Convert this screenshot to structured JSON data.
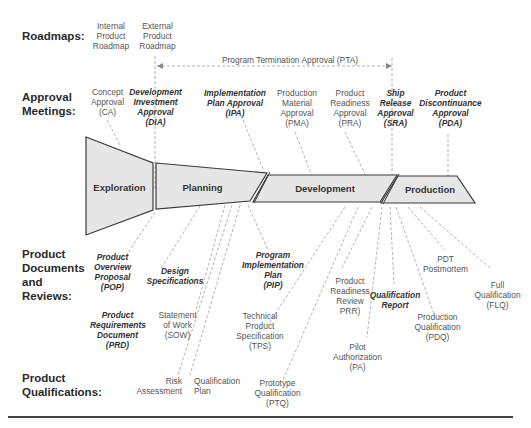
{
  "rows": {
    "roadmaps": "Roadmaps:",
    "approval": "Approval\nMeetings:",
    "documents": "Product\nDocuments\nand\nReviews:",
    "qualifications": "Product\nQualifications:"
  },
  "roadmaps": {
    "internal": "Internal\nProduct\nRoadmap",
    "external": "External\nProduct\nRoadmap"
  },
  "pta": "Program Termination Approval (PTA)",
  "approvals": {
    "ca": "Concept\nApproval\n(CA)",
    "dia": "Development\nInvestment\nApproval\n(DIA)",
    "ipa": "Implementation\nPlan Approval\n(IPA)",
    "pma": "Production\nMaterial\nApproval\n(PMA)",
    "pra": "Product\nReadiness\nApproval\n(PRA)",
    "sra": "Ship\nRelease\nApproval\n(SRA)",
    "pda": "Product\nDiscontinuance\nApproval\n(PDA)"
  },
  "phases": {
    "exploration": "Exploration",
    "planning": "Planning",
    "development": "Development",
    "production": "Production"
  },
  "documents": {
    "pop": "Product\nOverview\nProposal\n(POP)",
    "design": "Design\nSpecifications",
    "pip": "Program\nImplementation\nPlan\n(PIP)",
    "prr": "Product\nReadiness\nReview\nPRR)",
    "qual_report": "Qualification\nReport",
    "pdt": "PDT\nPostmortem",
    "prd": "Product\nRequirements\nDocument\n(PRD)",
    "sow": "Statement\nof Work\n(SOW)",
    "tps": "Technical\nProduct\nSpecification\n(TPS)"
  },
  "qualifications": {
    "risk": "Risk\nAssessment",
    "qual_plan": "Qualification\nPlan",
    "ptq": "Prototype\nQualification\n(PTQ)",
    "pa": "Pilot\nAuthorization\n(PA)",
    "pdq": "Production\nQualification\n(PDQ)",
    "flq": "Full\nQualification\n(FLQ)"
  },
  "colors": {
    "phase_fill": "#e6e6e6",
    "phase_stroke": "#3a3a3a",
    "dashed": "#9a9a9a"
  }
}
